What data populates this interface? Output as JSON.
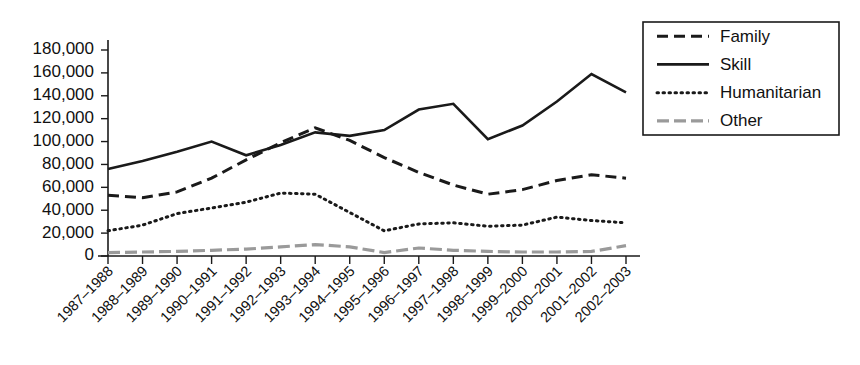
{
  "chart_data": {
    "type": "line",
    "title": "",
    "xlabel": "",
    "ylabel": "",
    "ylim": [
      0,
      180000
    ],
    "ytick_step": 20000,
    "grid": false,
    "legend_position": "right",
    "categories": [
      "1987–1988",
      "1988–1989",
      "1989–1990",
      "1990–1991",
      "1991–1992",
      "1992–1993",
      "1993–1994",
      "1994–1995",
      "1995–1996",
      "1996–1997",
      "1997–1998",
      "1998–1999",
      "1999–2000",
      "2000–2001",
      "2001–2002",
      "2002–2003"
    ],
    "ytick_labels": [
      "0",
      "20,000",
      "40,000",
      "60,000",
      "80,000",
      "100,000",
      "120,000",
      "140,000",
      "160,000",
      "180,000"
    ],
    "ytick_values": [
      0,
      20000,
      40000,
      60000,
      80000,
      100000,
      120000,
      140000,
      160000,
      180000
    ],
    "series": [
      {
        "name": "Family",
        "style": "dashed",
        "color": "#1a1a1a",
        "values": [
          53000,
          51000,
          56000,
          68000,
          84000,
          99000,
          112000,
          101000,
          86000,
          73000,
          62000,
          54000,
          58000,
          66000,
          71000,
          68000
        ]
      },
      {
        "name": "Skill",
        "style": "solid",
        "color": "#1a1a1a",
        "values": [
          76000,
          83000,
          91000,
          100000,
          88000,
          97000,
          108000,
          105000,
          110000,
          128000,
          133000,
          102000,
          114000,
          135000,
          159000,
          143000
        ]
      },
      {
        "name": "Humanitarian",
        "style": "dotted",
        "color": "#1a1a1a",
        "values": [
          22000,
          27000,
          37000,
          42000,
          47000,
          55000,
          54000,
          38000,
          22000,
          28000,
          29000,
          26000,
          27000,
          34000,
          31000,
          29000
        ]
      },
      {
        "name": "Other",
        "style": "dashdot",
        "color": "#9a9a9a",
        "values": [
          3000,
          3500,
          4000,
          5000,
          6000,
          8000,
          10000,
          8000,
          3000,
          7000,
          5000,
          4000,
          3500,
          3500,
          4000,
          9000
        ]
      }
    ]
  },
  "legend": {
    "items": [
      {
        "label": "Family"
      },
      {
        "label": "Skill"
      },
      {
        "label": "Humanitarian"
      },
      {
        "label": "Other"
      }
    ]
  }
}
